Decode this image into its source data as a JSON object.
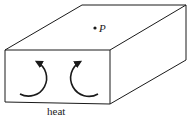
{
  "diagram": {
    "type": "3d-box-convection",
    "point_label": "P",
    "heat_label": "heat",
    "arrows": [
      {
        "name": "left-convection-arrow",
        "direction": "clockwise-up"
      },
      {
        "name": "right-convection-arrow",
        "direction": "counterclockwise-up"
      }
    ],
    "colors": {
      "stroke": "#1a1a1a",
      "background": "#ffffff"
    }
  }
}
